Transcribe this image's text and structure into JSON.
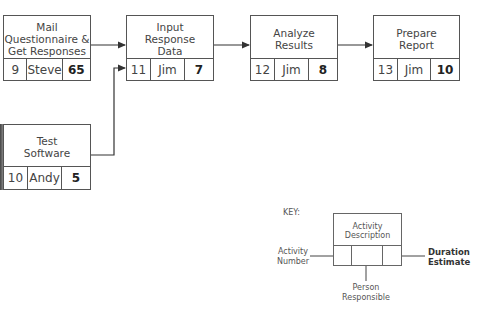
{
  "nodes": [
    {
      "id": "mail",
      "description": "Mail\nQuestionnaire &\nGet Responses",
      "activity_number": "9",
      "person": "Steve",
      "duration": "65"
    },
    {
      "id": "input",
      "description": "Input\nResponse\nData",
      "activity_number": "11",
      "person": "Jim",
      "duration": "7"
    },
    {
      "id": "analyze",
      "description": "Analyze\nResults",
      "activity_number": "12",
      "person": "Jim",
      "duration": "8"
    },
    {
      "id": "prepare",
      "description": "Prepare\nReport",
      "activity_number": "13",
      "person": "Jim",
      "duration": "10"
    },
    {
      "id": "test",
      "description": "Test\nSoftware",
      "activity_number": "10",
      "person": "Andy",
      "duration": "5"
    }
  ],
  "edges": [
    {
      "from": "mail",
      "to": "input"
    },
    {
      "from": "test",
      "to": "input"
    },
    {
      "from": "input",
      "to": "analyze"
    },
    {
      "from": "analyze",
      "to": "prepare"
    }
  ],
  "key": {
    "title": "KEY:",
    "box_description": "Activity\nDescription",
    "activity_number_label": "Activity\nNumber",
    "person_label": "Person\nResponsible",
    "duration_label": "Duration\nEstimate"
  }
}
